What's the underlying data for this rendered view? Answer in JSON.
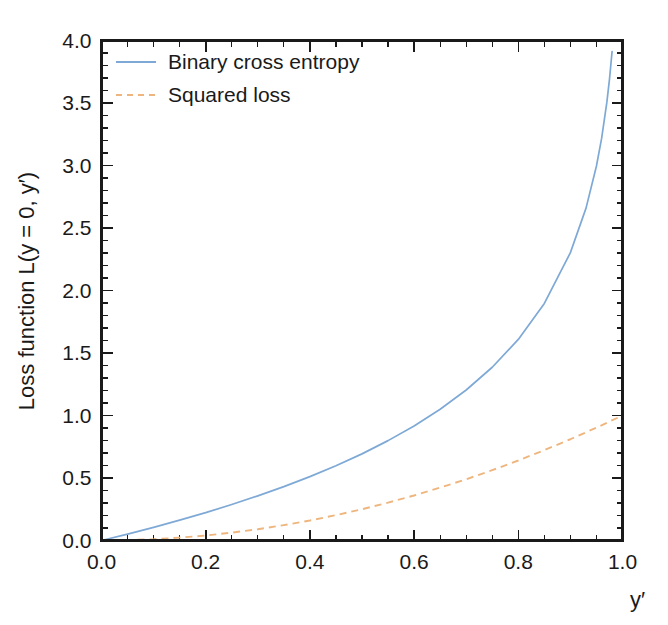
{
  "chart_data": {
    "type": "line",
    "title": "",
    "xlabel": "y′",
    "ylabel": "Loss function L(y = 0, y′)",
    "xlim": [
      0.0,
      1.0
    ],
    "ylim": [
      0.0,
      4.0
    ],
    "grid": false,
    "legend_position": "top-left inside axes",
    "x_ticks": [
      "0.0",
      "0.2",
      "0.4",
      "0.6",
      "0.8",
      "1.0"
    ],
    "x_tick_values": [
      0.0,
      0.2,
      0.4,
      0.6,
      0.8,
      1.0
    ],
    "x_minor_step": 0.05,
    "y_ticks": [
      "0.0",
      "0.5",
      "1.0",
      "1.5",
      "2.0",
      "2.5",
      "3.0",
      "3.5",
      "4.0"
    ],
    "y_tick_values": [
      0.0,
      0.5,
      1.0,
      1.5,
      2.0,
      2.5,
      3.0,
      3.5,
      4.0
    ],
    "y_minor_step": 0.1,
    "series": [
      {
        "name": "Binary cross entropy",
        "color": "#7ea9d6",
        "style": "solid",
        "formula": "-ln(1 - y')",
        "x": [
          0.0,
          0.05,
          0.1,
          0.15,
          0.2,
          0.25,
          0.3,
          0.35,
          0.4,
          0.45,
          0.5,
          0.55,
          0.6,
          0.65,
          0.7,
          0.75,
          0.8,
          0.85,
          0.9,
          0.93,
          0.95,
          0.96,
          0.97,
          0.975,
          0.98,
          0.982
        ],
        "values": [
          0.0,
          0.051,
          0.105,
          0.163,
          0.223,
          0.288,
          0.357,
          0.431,
          0.511,
          0.598,
          0.693,
          0.799,
          0.916,
          1.05,
          1.204,
          1.386,
          1.609,
          1.897,
          2.303,
          2.659,
          2.996,
          3.219,
          3.507,
          3.689,
          3.912,
          4.017
        ]
      },
      {
        "name": "Squared loss",
        "color": "#eeb67e",
        "style": "dashed",
        "formula": "y'^2",
        "x": [
          0.0,
          0.05,
          0.1,
          0.15,
          0.2,
          0.25,
          0.3,
          0.35,
          0.4,
          0.45,
          0.5,
          0.55,
          0.6,
          0.65,
          0.7,
          0.75,
          0.8,
          0.85,
          0.9,
          0.95,
          1.0
        ],
        "values": [
          0.0,
          0.003,
          0.01,
          0.023,
          0.04,
          0.063,
          0.09,
          0.123,
          0.16,
          0.203,
          0.25,
          0.303,
          0.36,
          0.423,
          0.49,
          0.563,
          0.64,
          0.723,
          0.81,
          0.903,
          1.0
        ]
      }
    ]
  },
  "legend": {
    "entries": [
      {
        "label": "Binary cross entropy"
      },
      {
        "label": "Squared loss"
      }
    ]
  },
  "axes": {
    "x_title": "y′",
    "y_title": "Loss function L(y = 0, y′)"
  },
  "colors": {
    "background": "#ffffff",
    "axis": "#1a1a1a",
    "series_bce": "#7ea9d6",
    "series_squared": "#eeb67e"
  }
}
